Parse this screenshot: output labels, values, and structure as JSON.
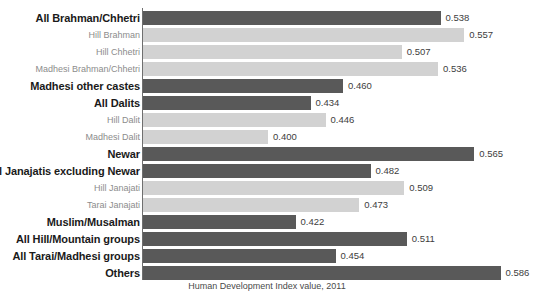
{
  "chart_data": {
    "type": "bar",
    "orientation": "horizontal",
    "title": "",
    "subtitle": "",
    "xlabel": "Human Development Index value, 2011",
    "ylabel": "",
    "xlim": [
      0.3,
      0.615
    ],
    "grid": false,
    "legend": null,
    "value_format": "0.000",
    "categories": [
      "All Brahman/Chhetri",
      "Hill Brahman",
      "Hill Chhetri",
      "Madhesi Brahman/Chhetri",
      "Madhesi other castes",
      "All Dalits",
      "Hill Dalit",
      "Madhesi Dalit",
      "Newar",
      "All Janajatis excluding Newar",
      "Hill Janajati",
      "Tarai Janajati",
      "Muslim/Musalman",
      "All Hill/Mountain groups",
      "All Tarai/Madhesi groups",
      "Others"
    ],
    "values": [
      0.538,
      0.557,
      0.507,
      0.536,
      0.46,
      0.434,
      0.446,
      0.4,
      0.565,
      0.482,
      0.509,
      0.473,
      0.422,
      0.511,
      0.454,
      0.586
    ],
    "value_labels": [
      "0.538",
      "0.557",
      "0.507",
      "0.536",
      "0.460",
      "0.434",
      "0.446",
      "0.400",
      "0.565",
      "0.482",
      "0.509",
      "0.473",
      "0.422",
      "0.511",
      "0.454",
      "0.586"
    ],
    "emphasis": [
      "major",
      "minor",
      "minor",
      "minor",
      "major",
      "major",
      "minor",
      "minor",
      "major",
      "major",
      "minor",
      "minor",
      "major",
      "major",
      "major",
      "major"
    ],
    "colors": {
      "bar_major": "#595959",
      "bar_minor": "#d2d2d2",
      "label_major": "#1a1a1a",
      "label_minor": "#8c8c8c",
      "value_text": "#3d3d3d",
      "axis": "#6f6f6f",
      "background": "#ffffff"
    }
  },
  "axis_caption": "Human Development Index value, 2011"
}
